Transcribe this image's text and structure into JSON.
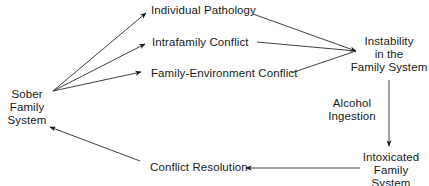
{
  "diagram": {
    "type": "flow-cycle",
    "nodes": {
      "sober": {
        "lines": [
          "Sober",
          "Family",
          "System"
        ]
      },
      "individual_pathology": {
        "label": "Individual Pathology"
      },
      "intrafamily_conflict": {
        "label": "Intrafamily Conflict"
      },
      "family_environment_conflict": {
        "label": "Family-Environment Conflict"
      },
      "instability": {
        "lines": [
          "Instability",
          "in the",
          "Family System"
        ]
      },
      "alcohol_ingestion": {
        "lines": [
          "Alcohol",
          "Ingestion"
        ]
      },
      "intoxicated": {
        "lines": [
          "Intoxicated",
          "Family",
          "System"
        ]
      },
      "conflict_resolution": {
        "label": "Conflict Resolution"
      }
    },
    "edges": [
      {
        "from": "Sober Family System",
        "to": "Individual Pathology"
      },
      {
        "from": "Sober Family System",
        "to": "Intrafamily Conflict"
      },
      {
        "from": "Sober Family System",
        "to": "Family-Environment Conflict"
      },
      {
        "from": "Individual Pathology",
        "to": "Instability in the Family System"
      },
      {
        "from": "Intrafamily Conflict",
        "to": "Instability in the Family System"
      },
      {
        "from": "Family-Environment Conflict",
        "to": "Instability in the Family System"
      },
      {
        "from": "Instability in the Family System",
        "to": "Intoxicated Family System",
        "label": "Alcohol Ingestion"
      },
      {
        "from": "Intoxicated Family System",
        "to": "Conflict Resolution"
      },
      {
        "from": "Conflict Resolution",
        "to": "Sober Family System"
      }
    ],
    "colors": {
      "line": "#2a2a2a",
      "text": "#1a1a1a",
      "background": "#ffffff"
    }
  }
}
